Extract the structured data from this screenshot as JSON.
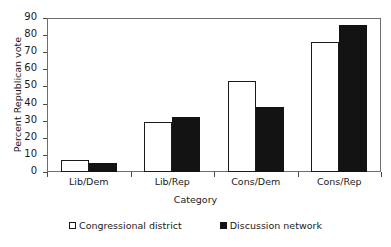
{
  "chart_data": {
    "type": "bar",
    "title": "",
    "xlabel": "Category",
    "ylabel": "Percent Republican vote",
    "categories": [
      "Lib/Dem",
      "Lib/Rep",
      "Cons/Dem",
      "Cons/Rep"
    ],
    "series": [
      {
        "name": "Congressional district",
        "values": [
          7,
          29,
          53,
          76
        ],
        "color": "#ffffff",
        "marker": "open-square"
      },
      {
        "name": "Discussion network",
        "values": [
          5.5,
          32,
          38,
          86
        ],
        "color": "#131313",
        "marker": "filled-square"
      }
    ],
    "ylim": [
      0,
      90
    ],
    "yticks": [
      0,
      10,
      20,
      30,
      40,
      50,
      60,
      70,
      80,
      90
    ],
    "ytick_labels": [
      "0",
      "10",
      "20",
      "30",
      "40",
      "50",
      "60",
      "70",
      "80",
      "90"
    ],
    "grid": false,
    "legend_position": "bottom",
    "frame": true
  }
}
